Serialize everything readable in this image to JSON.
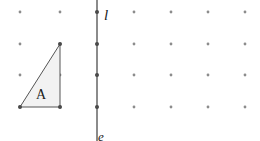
{
  "figure": {
    "width": 260,
    "height": 141,
    "background_color": "#ffffff"
  },
  "grid": {
    "name": "dot-grid",
    "columns_x": [
      20,
      60,
      97,
      134,
      171,
      208,
      245
    ],
    "rows_y": [
      12,
      44,
      75,
      107
    ],
    "dot_radius": 1.4,
    "dot_color": "#8c8c8c"
  },
  "mirror_line": {
    "label": "l",
    "label_x": 106,
    "label_y": 20,
    "x": 97,
    "y_start": -6,
    "y_end": 147,
    "color": "#6e6e6e",
    "width": 1.6
  },
  "clipped_label": {
    "text": "e",
    "x": 101,
    "y": 141
  },
  "shape": {
    "label": "A",
    "label_x": 41,
    "label_y": 99,
    "points": "20,107 60,107 60,44",
    "fill_color": "#f2f2f2",
    "stroke_color": "#545454",
    "stroke_width": 1,
    "vertices": [
      {
        "name": "bottom-left",
        "x": 20,
        "y": 107
      },
      {
        "name": "bottom-right",
        "x": 60,
        "y": 107
      },
      {
        "name": "top-right",
        "x": 60,
        "y": 44
      }
    ]
  },
  "chart_data": {
    "type": "scatter",
    "xlabel": "",
    "ylabel": "",
    "grid": true,
    "legend": "none",
    "xlim": [
      0,
      260
    ],
    "ylim": [
      0,
      141
    ],
    "grid_columns_x": [
      20,
      60,
      97,
      134,
      171,
      208,
      245
    ],
    "grid_rows_y": [
      12,
      44,
      75,
      107
    ],
    "annotations": [
      "l",
      "A",
      "e"
    ],
    "series": [
      {
        "name": "triangle-A",
        "x": [
          20,
          60,
          60,
          20
        ],
        "y": [
          107,
          107,
          44,
          107
        ]
      },
      {
        "name": "mirror-line-l",
        "x": [
          97,
          97
        ],
        "y": [
          -6,
          147
        ]
      }
    ]
  }
}
